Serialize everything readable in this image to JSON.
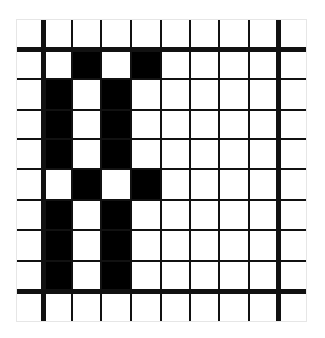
{
  "diagram": {
    "type": "pixel-grid",
    "rows": 10,
    "cols": 10,
    "colors": {
      "filled": "#000000",
      "empty": "#ffffff",
      "line": "#111111",
      "background": "#ffffff"
    },
    "col_edges": [
      16,
      43,
      72,
      101,
      131,
      161,
      190,
      219,
      249,
      278,
      307
    ],
    "row_edges": [
      19,
      49,
      79,
      110,
      139,
      169,
      200,
      230,
      261,
      291,
      322
    ],
    "thin_line_width": 2,
    "thick_line_width": 5,
    "thick_col_lines": [
      1,
      9
    ],
    "thick_row_lines": [
      1,
      9
    ],
    "cells": [
      [
        0,
        0,
        0,
        0,
        0,
        0,
        0,
        0,
        0,
        0
      ],
      [
        0,
        0,
        1,
        0,
        1,
        0,
        0,
        0,
        0,
        0
      ],
      [
        0,
        1,
        0,
        1,
        0,
        0,
        0,
        0,
        0,
        0
      ],
      [
        0,
        1,
        0,
        1,
        0,
        0,
        0,
        0,
        0,
        0
      ],
      [
        0,
        1,
        0,
        1,
        0,
        0,
        0,
        0,
        0,
        0
      ],
      [
        0,
        0,
        1,
        0,
        1,
        0,
        0,
        0,
        0,
        0
      ],
      [
        0,
        1,
        0,
        1,
        0,
        0,
        0,
        0,
        0,
        0
      ],
      [
        0,
        1,
        0,
        1,
        0,
        0,
        0,
        0,
        0,
        0
      ],
      [
        0,
        1,
        0,
        1,
        0,
        0,
        0,
        0,
        0,
        0
      ],
      [
        0,
        0,
        0,
        0,
        0,
        0,
        0,
        0,
        0,
        0
      ]
    ]
  }
}
